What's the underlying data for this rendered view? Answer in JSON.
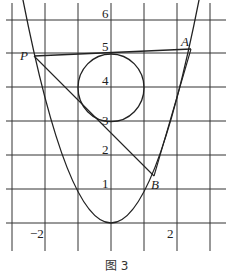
{
  "figure": {
    "caption": "图 3",
    "grid": {
      "x_ticks": [
        -3,
        -2,
        -1,
        0,
        1,
        2,
        3
      ],
      "y_ticks": [
        0,
        1,
        2,
        3,
        4,
        5,
        6
      ],
      "x_labels": {
        "neg2": "−2",
        "pos2": "2"
      },
      "y_labels": {
        "y1": "1",
        "y2": "2",
        "y3": "3",
        "y4": "4",
        "y5": "5",
        "y6": "6"
      }
    },
    "curves": {
      "parabola": "y = x^2",
      "circle": {
        "center": [
          0,
          4
        ],
        "radius": 1
      }
    },
    "points": {
      "P": {
        "label": "P",
        "coords": [
          -2.35,
          5.0
        ]
      },
      "A": {
        "label": "A",
        "coords": [
          2.35,
          5.1
        ]
      },
      "B": {
        "label": "B",
        "coords": [
          1.3,
          1.4
        ]
      }
    },
    "colors": {
      "stroke": "#222222",
      "grid": "#333333",
      "background": "#ffffff"
    }
  }
}
